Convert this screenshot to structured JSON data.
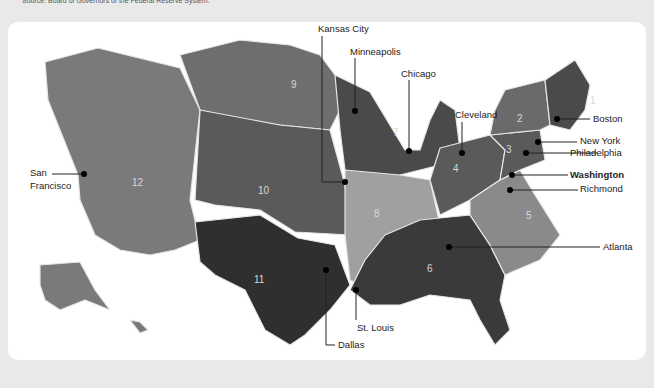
{
  "source": "Source: Board of Governors of the Federal Reserve System.",
  "colors": {
    "background": "#e9e9e9",
    "panel": "#ffffff",
    "district_dark": "#3a3a3a",
    "district_mid": "#5a5a5a",
    "district_medium": "#6e6e6e",
    "district_light": "#8a8a8a",
    "district_lightest": "#a8a8a8",
    "border": "#e0e0e0"
  },
  "districts": [
    {
      "number": "1",
      "bank": "Boston"
    },
    {
      "number": "2",
      "bank": "New York"
    },
    {
      "number": "3",
      "bank": "Philadelphia"
    },
    {
      "number": "4",
      "bank": "Cleveland"
    },
    {
      "number": "5",
      "bank": "Richmond"
    },
    {
      "number": "6",
      "bank": "Atlanta"
    },
    {
      "number": "7",
      "bank": "Chicago"
    },
    {
      "number": "8",
      "bank": "St. Louis"
    },
    {
      "number": "9",
      "bank": "Minneapolis"
    },
    {
      "number": "10",
      "bank": "Kansas City"
    },
    {
      "number": "11",
      "bank": "Dallas"
    },
    {
      "number": "12",
      "bank": "San Francisco"
    }
  ],
  "labels": {
    "kansas_city": "Kansas City",
    "minneapolis": "Minneapolis",
    "chicago": "Chicago",
    "cleveland": "Cleveland",
    "boston": "Boston",
    "new_york": "New York",
    "philadelphia": "Philadelphia",
    "washington": "Washington",
    "richmond": "Richmond",
    "atlanta": "Atlanta",
    "st_louis": "St. Louis",
    "dallas": "Dallas",
    "san_francisco_1": "San",
    "san_francisco_2": "Francisco"
  }
}
